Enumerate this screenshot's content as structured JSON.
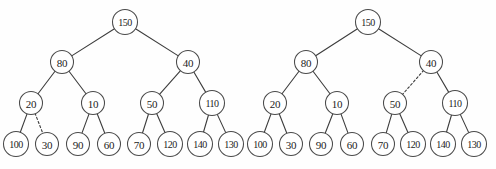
{
  "figure": {
    "background_color": "#fefefe",
    "stroke_color": "#3c3c3c",
    "node_fill": "#ffffff",
    "node_stroke": "#4a4a4a",
    "text_color": "#1c1c1c",
    "width": 496,
    "height": 169
  },
  "trees": [
    {
      "name": "left-tree",
      "root_label": "150",
      "nodes": [
        {
          "id": "L-150",
          "label": "150",
          "cx": 125,
          "cy": 22,
          "r": 12.5,
          "level": 0
        },
        {
          "id": "L-80",
          "label": "80",
          "cx": 62,
          "cy": 62,
          "r": 11.5,
          "level": 1
        },
        {
          "id": "L-40",
          "label": "40",
          "cx": 188,
          "cy": 62,
          "r": 11.5,
          "level": 1
        },
        {
          "id": "L-20",
          "label": "20",
          "cx": 31,
          "cy": 103,
          "r": 11.5,
          "level": 2
        },
        {
          "id": "L-10",
          "label": "10",
          "cx": 93,
          "cy": 103,
          "r": 11.5,
          "level": 2
        },
        {
          "id": "L-50",
          "label": "50",
          "cx": 152,
          "cy": 103,
          "r": 11.5,
          "level": 2
        },
        {
          "id": "L-110",
          "label": "110",
          "cx": 212,
          "cy": 103,
          "r": 12.5,
          "level": 2
        },
        {
          "id": "L-100",
          "label": "100",
          "cx": 16,
          "cy": 144,
          "r": 12.5,
          "level": 3
        },
        {
          "id": "L-30",
          "label": "30",
          "cx": 47,
          "cy": 144,
          "r": 11.5,
          "level": 3
        },
        {
          "id": "L-90",
          "label": "90",
          "cx": 78,
          "cy": 144,
          "r": 11.5,
          "level": 3
        },
        {
          "id": "L-60",
          "label": "60",
          "cx": 109,
          "cy": 144,
          "r": 11.5,
          "level": 3
        },
        {
          "id": "L-70",
          "label": "70",
          "cx": 139,
          "cy": 144,
          "r": 11.5,
          "level": 3
        },
        {
          "id": "L-120",
          "label": "120",
          "cx": 170,
          "cy": 144,
          "r": 12.5,
          "level": 3
        },
        {
          "id": "L-140",
          "label": "140",
          "cx": 200,
          "cy": 144,
          "r": 12.5,
          "level": 3
        },
        {
          "id": "L-130",
          "label": "130",
          "cx": 231,
          "cy": 144,
          "r": 12.5,
          "level": 3
        }
      ],
      "edges": [
        {
          "from": "L-150",
          "to": "L-80",
          "style": "solid"
        },
        {
          "from": "L-150",
          "to": "L-40",
          "style": "solid"
        },
        {
          "from": "L-80",
          "to": "L-20",
          "style": "solid"
        },
        {
          "from": "L-80",
          "to": "L-10",
          "style": "solid"
        },
        {
          "from": "L-40",
          "to": "L-50",
          "style": "solid"
        },
        {
          "from": "L-40",
          "to": "L-110",
          "style": "solid"
        },
        {
          "from": "L-20",
          "to": "L-100",
          "style": "solid"
        },
        {
          "from": "L-20",
          "to": "L-30",
          "style": "dashed"
        },
        {
          "from": "L-10",
          "to": "L-90",
          "style": "solid"
        },
        {
          "from": "L-10",
          "to": "L-60",
          "style": "solid"
        },
        {
          "from": "L-50",
          "to": "L-70",
          "style": "solid"
        },
        {
          "from": "L-50",
          "to": "L-120",
          "style": "solid"
        },
        {
          "from": "L-110",
          "to": "L-140",
          "style": "solid"
        },
        {
          "from": "L-110",
          "to": "L-130",
          "style": "solid"
        }
      ],
      "dashed_edge_description": "20 to 30"
    },
    {
      "name": "right-tree",
      "root_label": "150",
      "nodes": [
        {
          "id": "R-150",
          "label": "150",
          "cx": 368,
          "cy": 22,
          "r": 12.5,
          "level": 0
        },
        {
          "id": "R-80",
          "label": "80",
          "cx": 306,
          "cy": 62,
          "r": 11.5,
          "level": 1
        },
        {
          "id": "R-40",
          "label": "40",
          "cx": 431,
          "cy": 62,
          "r": 11.5,
          "level": 1
        },
        {
          "id": "R-20",
          "label": "20",
          "cx": 275,
          "cy": 103,
          "r": 11.5,
          "level": 2
        },
        {
          "id": "R-10",
          "label": "10",
          "cx": 337,
          "cy": 103,
          "r": 11.5,
          "level": 2
        },
        {
          "id": "R-50",
          "label": "50",
          "cx": 395,
          "cy": 103,
          "r": 11.5,
          "level": 2
        },
        {
          "id": "R-110",
          "label": "110",
          "cx": 455,
          "cy": 103,
          "r": 12.5,
          "level": 2
        },
        {
          "id": "R-100",
          "label": "100",
          "cx": 260,
          "cy": 144,
          "r": 12.5,
          "level": 3
        },
        {
          "id": "R-30",
          "label": "30",
          "cx": 291,
          "cy": 144,
          "r": 11.5,
          "level": 3
        },
        {
          "id": "R-90",
          "label": "90",
          "cx": 321,
          "cy": 144,
          "r": 11.5,
          "level": 3
        },
        {
          "id": "R-60",
          "label": "60",
          "cx": 352,
          "cy": 144,
          "r": 11.5,
          "level": 3
        },
        {
          "id": "R-70",
          "label": "70",
          "cx": 383,
          "cy": 144,
          "r": 11.5,
          "level": 3
        },
        {
          "id": "R-120",
          "label": "120",
          "cx": 413,
          "cy": 144,
          "r": 12.5,
          "level": 3
        },
        {
          "id": "R-140",
          "label": "140",
          "cx": 443,
          "cy": 144,
          "r": 12.5,
          "level": 3
        },
        {
          "id": "R-130",
          "label": "130",
          "cx": 474,
          "cy": 144,
          "r": 12.5,
          "level": 3
        }
      ],
      "edges": [
        {
          "from": "R-150",
          "to": "R-80",
          "style": "solid"
        },
        {
          "from": "R-150",
          "to": "R-40",
          "style": "solid"
        },
        {
          "from": "R-80",
          "to": "R-20",
          "style": "solid"
        },
        {
          "from": "R-80",
          "to": "R-10",
          "style": "solid"
        },
        {
          "from": "R-40",
          "to": "R-50",
          "style": "dashed"
        },
        {
          "from": "R-40",
          "to": "R-110",
          "style": "solid"
        },
        {
          "from": "R-20",
          "to": "R-100",
          "style": "solid"
        },
        {
          "from": "R-20",
          "to": "R-30",
          "style": "solid"
        },
        {
          "from": "R-10",
          "to": "R-90",
          "style": "solid"
        },
        {
          "from": "R-10",
          "to": "R-60",
          "style": "solid"
        },
        {
          "from": "R-50",
          "to": "R-70",
          "style": "solid"
        },
        {
          "from": "R-50",
          "to": "R-120",
          "style": "solid"
        },
        {
          "from": "R-110",
          "to": "R-140",
          "style": "solid"
        },
        {
          "from": "R-110",
          "to": "R-130",
          "style": "solid"
        }
      ],
      "dashed_edge_description": "40 to 50"
    }
  ]
}
